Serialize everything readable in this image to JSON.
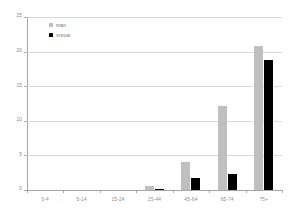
{
  "chart_data": {
    "type": "bar",
    "title": "",
    "subtitle": "",
    "xlabel": "",
    "ylabel": "",
    "categories": [
      "0-4",
      "5-14",
      "15-24",
      "25-44",
      "45-64",
      "65-74",
      "75+"
    ],
    "series": [
      {
        "name": "man",
        "color": "#bfbfbf",
        "values": [
          0,
          0,
          0,
          0.6,
          4.1,
          12.1,
          20.8
        ]
      },
      {
        "name": "vrouw",
        "color": "#000000",
        "values": [
          0,
          0,
          0,
          0.1,
          1.8,
          2.3,
          18.8
        ]
      }
    ],
    "ylim": [
      0,
      25
    ],
    "yticks": [
      0,
      5,
      10,
      15,
      20,
      25
    ],
    "ytick_labels": [
      "0",
      "5",
      "10",
      "15",
      "20",
      "25"
    ],
    "grid": true,
    "grid_axis": "y",
    "legend_position": "top-left-inside",
    "axis_color": "#a6a6a6",
    "grid_color": "#d9d9d9",
    "tick_label_color": "#808080",
    "background": "#ffffff"
  },
  "legend": {
    "entries": [
      {
        "label": "man"
      },
      {
        "label": "vrouw"
      }
    ]
  }
}
